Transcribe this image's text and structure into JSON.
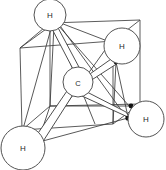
{
  "figure": {
    "background_color": "#ffffff",
    "line_color": "#4a4a4a",
    "bond_fill_color": "#ffffff",
    "vertex_dot_color": "#111111",
    "width": 166,
    "height": 170
  },
  "atoms": [
    {
      "id": "carbon",
      "label": "C",
      "cx": 78,
      "cy": 82,
      "r": 15
    },
    {
      "id": "hydrogen-top",
      "label": "H",
      "cx": 50,
      "cy": 15,
      "r": 16
    },
    {
      "id": "hydrogen-upper-right",
      "label": "H",
      "cx": 122,
      "cy": 46,
      "r": 18
    },
    {
      "id": "hydrogen-lower-right",
      "label": "H",
      "cx": 146,
      "cy": 119,
      "r": 18
    },
    {
      "id": "hydrogen-bottom-left",
      "label": "H",
      "cx": 23,
      "cy": 148,
      "r": 22
    }
  ],
  "vertices": [
    {
      "id": "top-back-left",
      "x": 50,
      "y": 23
    },
    {
      "id": "top-front-left",
      "x": 57,
      "y": 21
    },
    {
      "id": "upper-right-node",
      "x": 110,
      "y": 42
    },
    {
      "id": "upper-right-lower",
      "x": 116,
      "y": 62
    },
    {
      "id": "lower-right-node",
      "x": 131,
      "y": 106
    },
    {
      "id": "lower-right-front",
      "x": 128,
      "y": 118
    },
    {
      "id": "bottom-left-upper",
      "x": 22,
      "y": 130
    },
    {
      "id": "bottom-left-front",
      "x": 38,
      "y": 142
    }
  ],
  "bonds": [
    {
      "id": "bond-c-h-top",
      "from": "carbon",
      "to": "hydrogen-top"
    },
    {
      "id": "bond-c-h-upper-right",
      "from": "carbon",
      "to": "hydrogen-upper-right"
    },
    {
      "id": "bond-c-h-lower-right",
      "from": "carbon",
      "to": "hydrogen-lower-right"
    },
    {
      "id": "bond-c-h-bottom-left",
      "from": "carbon",
      "to": "hydrogen-bottom-left"
    }
  ],
  "cube": {
    "description": "Wireframe cube in oblique projection enclosing the molecule",
    "corners": {
      "front-top-left": {
        "x": 20,
        "y": 48
      },
      "front-top-right": {
        "x": 110,
        "y": 42
      },
      "front-bottom-left": {
        "x": 22,
        "y": 130
      },
      "front-bottom-right": {
        "x": 113,
        "y": 124
      },
      "back-top-left": {
        "x": 50,
        "y": 23
      },
      "back-top-right": {
        "x": 140,
        "y": 20
      },
      "back-bottom-left": {
        "x": 50,
        "y": 106
      },
      "back-bottom-right": {
        "x": 140,
        "y": 104
      }
    }
  }
}
